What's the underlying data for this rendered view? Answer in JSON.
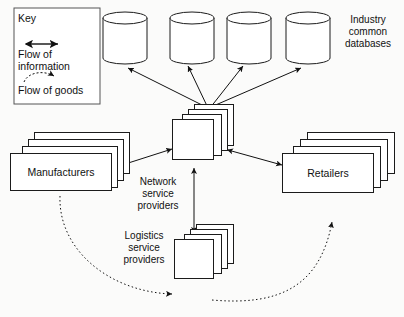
{
  "diagram": {
    "background_color": "#fbfbfa",
    "stroke_color": "#1b1b1b",
    "fill_color": "#ffffff"
  },
  "key": {
    "title": "Key",
    "items": [
      {
        "icon": "double-headed-arrow-icon",
        "label": "Flow of\ninformation",
        "style": "solid"
      },
      {
        "icon": "dashed-curved-arrow-icon",
        "label": "Flow of goods",
        "style": "dashed"
      }
    ]
  },
  "databases": {
    "caption": "Industry\ncommon\ndatabases",
    "count": 4,
    "items": [
      {
        "name": "database-1"
      },
      {
        "name": "database-2"
      },
      {
        "name": "database-3"
      },
      {
        "name": "database-4"
      }
    ]
  },
  "nodes": {
    "manufacturers": {
      "label": "Manufacturers",
      "stack_count": 4
    },
    "retailers": {
      "label": "Retailers",
      "stack_count": 4
    },
    "network_service_providers": {
      "label": "Network\nservice\nproviders",
      "stack_count": 4
    },
    "logistics_service_providers": {
      "label": "Logistics\nservice\nproviders",
      "stack_count": 4
    }
  },
  "connections": [
    {
      "name": "nsp-to-database-1",
      "from": "network-service-providers",
      "to": "database-1",
      "type": "information",
      "heads": "single"
    },
    {
      "name": "nsp-to-database-2",
      "from": "network-service-providers",
      "to": "database-2",
      "type": "information",
      "heads": "single"
    },
    {
      "name": "nsp-to-database-3",
      "from": "network-service-providers",
      "to": "database-3",
      "type": "information",
      "heads": "single"
    },
    {
      "name": "nsp-to-database-4",
      "from": "network-service-providers",
      "to": "database-4",
      "type": "information",
      "heads": "single"
    },
    {
      "name": "manufacturers-to-nsp",
      "from": "manufacturers",
      "to": "network-service-providers",
      "type": "information",
      "heads": "double"
    },
    {
      "name": "nsp-to-retailers",
      "from": "network-service-providers",
      "to": "retailers",
      "type": "information",
      "heads": "double"
    },
    {
      "name": "lsp-to-nsp",
      "from": "logistics-service-providers",
      "to": "network-service-providers",
      "type": "information",
      "heads": "double"
    },
    {
      "name": "manufacturers-to-lsp-goods",
      "from": "manufacturers",
      "to": "logistics-service-providers",
      "type": "goods",
      "heads": "single"
    },
    {
      "name": "lsp-to-retailers-goods",
      "from": "logistics-service-providers",
      "to": "retailers",
      "type": "goods",
      "heads": "single"
    }
  ]
}
